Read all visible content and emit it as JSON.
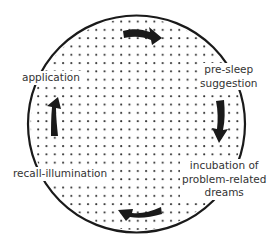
{
  "diagram": {
    "type": "cycle",
    "circle": {
      "cx": 136.5,
      "cy": 124,
      "r": 108.5,
      "stroke": "#1a1a1a",
      "fill": "#ffffff",
      "dot_color": "#333333",
      "dot_spacing": 8.3
    },
    "stages": [
      {
        "id": "pre-sleep-suggestion",
        "lines": [
          "pre-sleep",
          "suggestion"
        ]
      },
      {
        "id": "incubation",
        "lines": [
          "incubation of",
          "problem-related",
          "dreams"
        ]
      },
      {
        "id": "recall-illumination",
        "lines": [
          "recall-illumination"
        ]
      },
      {
        "id": "application",
        "lines": [
          "application"
        ]
      }
    ],
    "arrows": [
      {
        "position": "top",
        "direction": "right"
      },
      {
        "position": "right",
        "direction": "down"
      },
      {
        "position": "bottom",
        "direction": "left"
      },
      {
        "position": "left",
        "direction": "up"
      }
    ],
    "arrow_color": "#1a1a1a"
  }
}
